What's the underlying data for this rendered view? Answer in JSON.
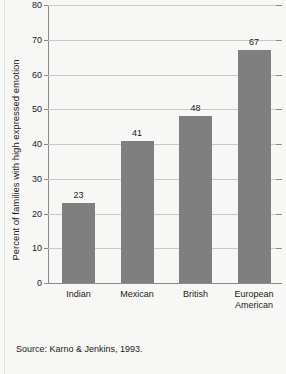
{
  "chart_data": {
    "type": "bar",
    "title": "",
    "subtitle": "",
    "xlabel": "",
    "ylabel": "Percent of families with high expressed emotion",
    "categories": [
      "Indian",
      "Mexican",
      "British",
      "European American"
    ],
    "category_lines": [
      [
        "Indian"
      ],
      [
        "Mexican"
      ],
      [
        "British"
      ],
      [
        "European",
        "American"
      ]
    ],
    "values": [
      23,
      41,
      48,
      67
    ],
    "value_labels": [
      "23",
      "41",
      "48",
      "67"
    ],
    "ylim": [
      0,
      80
    ],
    "ytick_step": 10,
    "ytick_labels": [
      "0",
      "10",
      "20",
      "30",
      "40",
      "50",
      "60",
      "70",
      "80"
    ],
    "grid": true,
    "grid_axis": "y",
    "legend": null,
    "bar_color": "#7f7f7f",
    "grid_color": "#c9c9c9",
    "axis_color": "#8a8a8a",
    "background_color": "#f7f7f5",
    "text_color": "#1b1b1b"
  },
  "source": {
    "text": "Source: Karno & Jenkins, 1993."
  }
}
